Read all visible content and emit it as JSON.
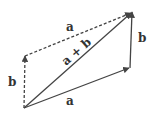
{
  "diagram": {
    "colors": {
      "stroke": "#444444",
      "label": "#333333",
      "background": "#ffffff"
    },
    "points": {
      "origin": [
        24,
        108
      ],
      "a_end": [
        129,
        68
      ],
      "b_end": [
        25,
        56
      ],
      "sum_end": [
        132,
        12
      ]
    },
    "vectors": [
      {
        "id": "a",
        "from": "origin",
        "to": "a_end",
        "style": "solid",
        "label": "a"
      },
      {
        "id": "b_right",
        "from": "a_end",
        "to": "sum_end",
        "style": "solid",
        "label": "b"
      },
      {
        "id": "sum",
        "from": "origin",
        "to": "sum_end",
        "style": "solid",
        "label": "a + b"
      },
      {
        "id": "b_left",
        "from": "origin",
        "to": "b_end",
        "style": "dashed",
        "label": "b"
      },
      {
        "id": "a_top",
        "from": "b_end",
        "to": "sum_end",
        "style": "dashed",
        "label": "a"
      }
    ],
    "labels": {
      "bottom_a": "a",
      "right_b": "b",
      "diagonal_sum": "a + b",
      "left_b": "b",
      "top_a": "a"
    }
  }
}
